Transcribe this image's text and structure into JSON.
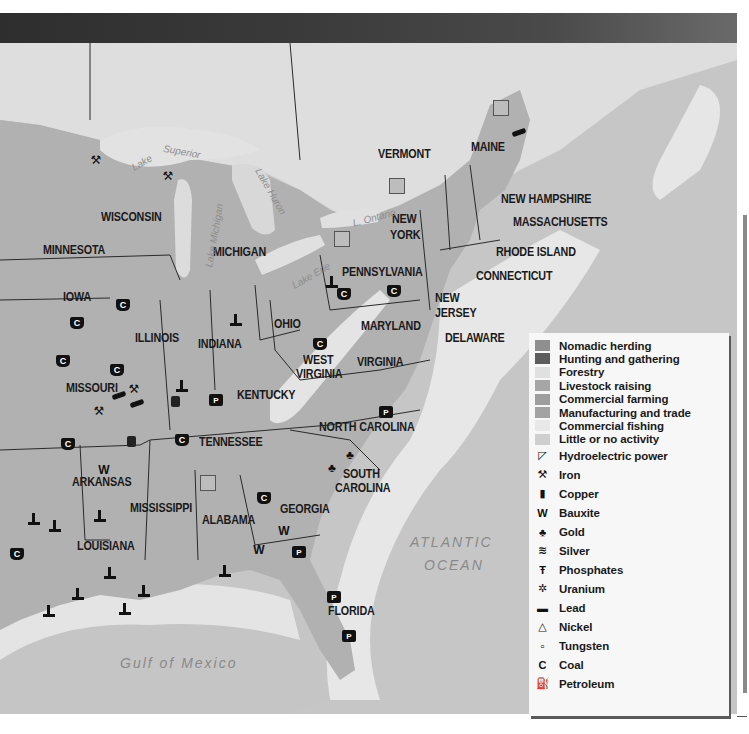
{
  "header": {
    "bar_color": "#333333"
  },
  "map": {
    "colors": {
      "background_land": "#d9d9d9",
      "canada": "#dcdcdc",
      "ocean": "#c4c4c4",
      "coastal_fishing": "#e6e6e6",
      "commercial_farming": "#a9a9a9",
      "manufacturing": "#a3a3a3",
      "livestock": "#b2b2b2",
      "forestry": "#e2e2e2",
      "state_border": "#2a2a2a"
    },
    "states": [
      {
        "name": "MINNESOTA",
        "x": 43,
        "y": 244
      },
      {
        "name": "WISCONSIN",
        "x": 101,
        "y": 211
      },
      {
        "name": "MICHIGAN",
        "x": 213,
        "y": 246
      },
      {
        "name": "IOWA",
        "x": 63,
        "y": 291
      },
      {
        "name": "ILLINOIS",
        "x": 135,
        "y": 332
      },
      {
        "name": "INDIANA",
        "x": 198,
        "y": 338
      },
      {
        "name": "OHIO",
        "x": 274,
        "y": 318
      },
      {
        "name": "MISSOURI",
        "x": 66,
        "y": 382
      },
      {
        "name": "KENTUCKY",
        "x": 237,
        "y": 389
      },
      {
        "name": "WEST",
        "x": 303,
        "y": 354
      },
      {
        "name": "VIRGINIA",
        "x": 296,
        "y": 368
      },
      {
        "name": "VIRGINIA",
        "x": 357,
        "y": 356
      },
      {
        "name": "TENNESSEE",
        "x": 199,
        "y": 436
      },
      {
        "name": "NORTH CAROLINA",
        "x": 319,
        "y": 421
      },
      {
        "name": "SOUTH",
        "x": 343,
        "y": 468
      },
      {
        "name": "CAROLINA",
        "x": 335,
        "y": 482
      },
      {
        "name": "ARKANSAS",
        "x": 72,
        "y": 476
      },
      {
        "name": "MISSISSIPPI",
        "x": 130,
        "y": 502
      },
      {
        "name": "ALABAMA",
        "x": 202,
        "y": 514
      },
      {
        "name": "GEORGIA",
        "x": 280,
        "y": 503
      },
      {
        "name": "LOUISIANA",
        "x": 77,
        "y": 540
      },
      {
        "name": "FLORIDA",
        "x": 328,
        "y": 605
      },
      {
        "name": "PENNSYLVANIA",
        "x": 342,
        "y": 266
      },
      {
        "name": "NEW",
        "x": 392,
        "y": 213
      },
      {
        "name": "YORK",
        "x": 390,
        "y": 229
      },
      {
        "name": "MARYLAND",
        "x": 361,
        "y": 320
      },
      {
        "name": "NEW",
        "x": 435,
        "y": 292
      },
      {
        "name": "JERSEY",
        "x": 435,
        "y": 307
      },
      {
        "name": "DELAWARE",
        "x": 445,
        "y": 332
      },
      {
        "name": "VERMONT",
        "x": 378,
        "y": 148
      },
      {
        "name": "MAINE",
        "x": 471,
        "y": 141
      },
      {
        "name": "NEW HAMPSHIRE",
        "x": 501,
        "y": 193
      },
      {
        "name": "MASSACHUSETTS",
        "x": 513,
        "y": 216
      },
      {
        "name": "RHODE ISLAND",
        "x": 496,
        "y": 246
      },
      {
        "name": "CONNECTICUT",
        "x": 476,
        "y": 270
      }
    ],
    "water_labels": [
      {
        "name": "ATLANTIC",
        "x": 410,
        "y": 534
      },
      {
        "name": "OCEAN",
        "x": 424,
        "y": 557
      },
      {
        "name": "Gulf of Mexico",
        "x": 120,
        "y": 655
      }
    ],
    "lake_labels": [
      {
        "name": "Lake",
        "x": 131,
        "y": 157,
        "rot": -30
      },
      {
        "name": "Superior",
        "x": 163,
        "y": 146,
        "rot": 10
      },
      {
        "name": "Lake Michigan",
        "x": 182,
        "y": 230,
        "rot": -80
      },
      {
        "name": "Lake Huron",
        "x": 245,
        "y": 186,
        "rot": 60
      },
      {
        "name": "L. Ontario",
        "x": 352,
        "y": 212,
        "rot": -15
      },
      {
        "name": "Lake Erie",
        "x": 290,
        "y": 270,
        "rot": -30
      }
    ],
    "resources": [
      {
        "type": "iron",
        "x": 89,
        "y": 154
      },
      {
        "type": "iron",
        "x": 161,
        "y": 170
      },
      {
        "type": "coal",
        "x": 116,
        "y": 299
      },
      {
        "type": "coal",
        "x": 70,
        "y": 317
      },
      {
        "type": "coal",
        "x": 56,
        "y": 355
      },
      {
        "type": "coal",
        "x": 110,
        "y": 364
      },
      {
        "type": "iron",
        "x": 127,
        "y": 383
      },
      {
        "type": "iron",
        "x": 92,
        "y": 405
      },
      {
        "type": "lead",
        "x": 112,
        "y": 393
      },
      {
        "type": "lead",
        "x": 130,
        "y": 401
      },
      {
        "type": "petroleum",
        "x": 229,
        "y": 314
      },
      {
        "type": "petroleum",
        "x": 175,
        "y": 380
      },
      {
        "type": "copper",
        "x": 171,
        "y": 396
      },
      {
        "type": "phosphate",
        "x": 209,
        "y": 394
      },
      {
        "type": "coal",
        "x": 61,
        "y": 438
      },
      {
        "type": "copper",
        "x": 127,
        "y": 436
      },
      {
        "type": "coal",
        "x": 175,
        "y": 434
      },
      {
        "type": "bauxite",
        "x": 97,
        "y": 464
      },
      {
        "type": "hydro",
        "x": 200,
        "y": 475
      },
      {
        "type": "coal",
        "x": 257,
        "y": 492
      },
      {
        "type": "bauxite",
        "x": 277,
        "y": 525
      },
      {
        "type": "bauxite",
        "x": 252,
        "y": 544
      },
      {
        "type": "phosphate",
        "x": 292,
        "y": 546
      },
      {
        "type": "petroleum",
        "x": 218,
        "y": 565
      },
      {
        "type": "coal",
        "x": 337,
        "y": 288
      },
      {
        "type": "coal",
        "x": 387,
        "y": 285
      },
      {
        "type": "petroleum",
        "x": 325,
        "y": 276
      },
      {
        "type": "coal",
        "x": 313,
        "y": 338
      },
      {
        "type": "phosphate",
        "x": 379,
        "y": 406
      },
      {
        "type": "gold",
        "x": 343,
        "y": 449
      },
      {
        "type": "gold",
        "x": 325,
        "y": 462
      },
      {
        "type": "phosphate",
        "x": 327,
        "y": 591
      },
      {
        "type": "phosphate",
        "x": 342,
        "y": 630
      },
      {
        "type": "petroleum",
        "x": 27,
        "y": 513
      },
      {
        "type": "petroleum",
        "x": 48,
        "y": 520
      },
      {
        "type": "petroleum",
        "x": 93,
        "y": 510
      },
      {
        "type": "coal",
        "x": 10,
        "y": 548
      },
      {
        "type": "petroleum",
        "x": 103,
        "y": 567
      },
      {
        "type": "petroleum",
        "x": 71,
        "y": 588
      },
      {
        "type": "petroleum",
        "x": 137,
        "y": 585
      },
      {
        "type": "petroleum",
        "x": 118,
        "y": 603
      },
      {
        "type": "petroleum",
        "x": 42,
        "y": 605
      },
      {
        "type": "hydro",
        "x": 389,
        "y": 178
      },
      {
        "type": "hydro",
        "x": 334,
        "y": 231
      },
      {
        "type": "hydro",
        "x": 493,
        "y": 100
      },
      {
        "type": "lead",
        "x": 512,
        "y": 130
      }
    ]
  },
  "legend": {
    "activities": [
      {
        "label": "Nomadic herding",
        "color": "#8f8f8f"
      },
      {
        "label": "Hunting and gathering",
        "color": "#5c5c5c"
      },
      {
        "label": "Forestry",
        "color": "#e0e0e0"
      },
      {
        "label": "Livestock raising",
        "color": "#a6a6a6"
      },
      {
        "label": "Commercial farming",
        "color": "#9e9e9e"
      },
      {
        "label": "Manufacturing and trade",
        "color": "#a2a2a2"
      },
      {
        "label": "Commercial fishing",
        "color": "#e8e8e8"
      },
      {
        "label": "Little or no activity",
        "color": "#cfcfcf"
      }
    ],
    "resources": [
      {
        "label": "Hydroelectric power",
        "icon": "hydroelectric-icon",
        "glyph": "◸"
      },
      {
        "label": "Iron",
        "icon": "iron-icon",
        "glyph": "⚒"
      },
      {
        "label": "Copper",
        "icon": "copper-icon",
        "glyph": "▮"
      },
      {
        "label": "Bauxite",
        "icon": "bauxite-icon",
        "glyph": "W"
      },
      {
        "label": "Gold",
        "icon": "gold-icon",
        "glyph": "♣"
      },
      {
        "label": "Silver",
        "icon": "silver-icon",
        "glyph": "≋"
      },
      {
        "label": "Phosphates",
        "icon": "phosphates-icon",
        "glyph": "Ŧ"
      },
      {
        "label": "Uranium",
        "icon": "uranium-icon",
        "glyph": "✲"
      },
      {
        "label": "Lead",
        "icon": "lead-icon",
        "glyph": "▬"
      },
      {
        "label": "Nickel",
        "icon": "nickel-icon",
        "glyph": "△"
      },
      {
        "label": "Tungsten",
        "icon": "tungsten-icon",
        "glyph": "▫"
      },
      {
        "label": "Coal",
        "icon": "coal-icon",
        "glyph": "C"
      },
      {
        "label": "Petroleum",
        "icon": "petroleum-icon",
        "glyph": "⛽"
      }
    ]
  }
}
